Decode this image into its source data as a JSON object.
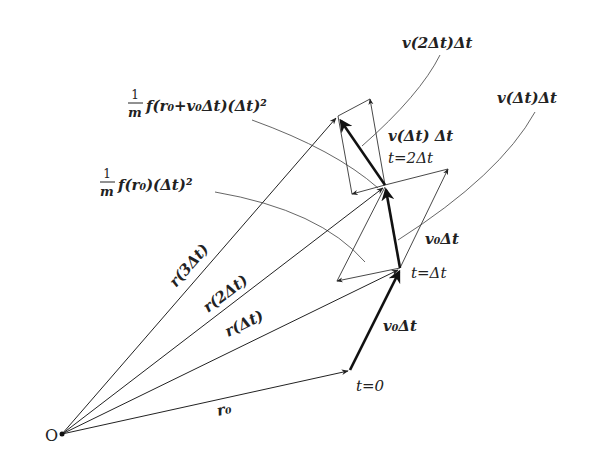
{
  "diagram": {
    "colors": {
      "line": "#222222",
      "thin": "#333333",
      "leader": "#555555",
      "background": "#ffffff"
    },
    "origin": {
      "label": "O"
    },
    "points": [
      {
        "name": "t0",
        "label": "t=0"
      },
      {
        "name": "t1",
        "label": "t=Δt"
      },
      {
        "name": "t2",
        "label": "t=2Δt"
      }
    ],
    "position_vectors": [
      {
        "label": "r₀"
      },
      {
        "label": "r(Δt)"
      },
      {
        "label": "r(2Δt)"
      },
      {
        "label": "r(3Δt)"
      }
    ],
    "step_labels": {
      "v0dt_lower": "v₀Δt",
      "v0dt_upper": "v₀Δt",
      "v_dt_dt_inline": "v(Δt) Δt",
      "v_dt_dt_callout": "v(Δt)Δt",
      "v_2dt_dt_callout": "v(2Δt)Δt"
    },
    "force_labels": {
      "f_r0": {
        "frac_num": "1",
        "frac_den": "m",
        "body": "f(r₀)(Δt)²"
      },
      "f_r0_v0dt": {
        "frac_num": "1",
        "frac_den": "m",
        "body": "f(r₀+v₀Δt)(Δt)²"
      }
    }
  }
}
